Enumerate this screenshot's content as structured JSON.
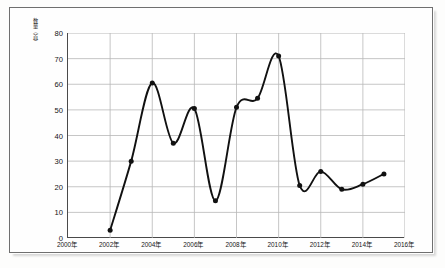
{
  "chart_data": {
    "type": "line",
    "title": "",
    "xlabel": "",
    "ylabel": "数量（首）",
    "x": [
      "2002年",
      "2003年",
      "2004年",
      "2005年",
      "2006年",
      "2007年",
      "2008年",
      "2009年",
      "2010年",
      "2011年",
      "2012年",
      "2013年",
      "2014年",
      "2015年"
    ],
    "x_numeric": [
      2002,
      2003,
      2004,
      2005,
      2006,
      2007,
      2008,
      2009,
      2010,
      2011,
      2012,
      2013,
      2014,
      2015
    ],
    "values": [
      3,
      30,
      60.5,
      37,
      50.5,
      14.5,
      51,
      54.5,
      71,
      20.5,
      26,
      19,
      21,
      25
    ],
    "series": [
      {
        "name": "数量（首）",
        "values": [
          3,
          30,
          60.5,
          37,
          50.5,
          14.5,
          51,
          54.5,
          71,
          20.5,
          26,
          19,
          21,
          25
        ]
      }
    ],
    "xlim": [
      2000,
      2016
    ],
    "ylim": [
      0,
      80
    ],
    "y_ticks": [
      0,
      10,
      20,
      30,
      40,
      50,
      60,
      70,
      80
    ],
    "y_tick_labels": [
      "0",
      "10",
      "20",
      "30",
      "40",
      "50",
      "60",
      "70",
      "80"
    ],
    "x_ticks": [
      2000,
      2002,
      2004,
      2006,
      2008,
      2010,
      2012,
      2014,
      2016
    ],
    "x_tick_labels": [
      "2000年",
      "2002年",
      "2004年",
      "2006年",
      "2008年",
      "2010年",
      "2012年",
      "2014年",
      "2016年"
    ],
    "grid": true,
    "grid_color": "#b8b8b8",
    "line_color": "#111111",
    "marker": "circle",
    "marker_color": "#111111",
    "legend": false,
    "smooth": true
  }
}
